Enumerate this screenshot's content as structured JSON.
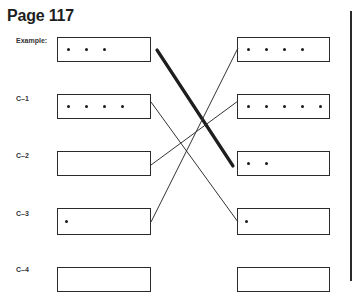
{
  "page_title": "Page 117",
  "left_column": [
    {
      "label": "Example:",
      "dots": 3
    },
    {
      "label": "C–1",
      "dots": 4
    },
    {
      "label": "C–2",
      "dots": 0
    },
    {
      "label": "C–3",
      "dots": 1
    },
    {
      "label": "C–4",
      "dots": 0
    }
  ],
  "right_column": [
    {
      "dots": 4
    },
    {
      "dots": 5
    },
    {
      "dots": 2
    },
    {
      "dots": 1
    },
    {
      "dots": 0
    }
  ],
  "connections": [
    {
      "from": "Example:",
      "to_right_index": 2,
      "style": "thick"
    },
    {
      "from": "C–1",
      "to_right_index": 3,
      "style": "thin"
    },
    {
      "from": "C–2",
      "to_right_index": 1,
      "style": "thin"
    },
    {
      "from": "C–3",
      "to_right_index": 0,
      "style": "thin"
    }
  ]
}
